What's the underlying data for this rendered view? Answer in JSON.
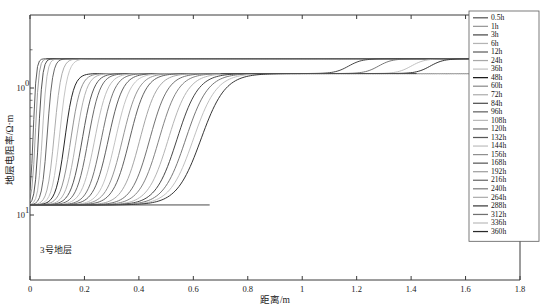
{
  "figure": {
    "background": "#ffffff",
    "plot_border_color": "#3a3a3a",
    "annotation": "3号地层"
  },
  "axes": {
    "x_title": "距离/m",
    "y_title": "地层电阻率/Ω·m",
    "x_ticks": [
      "0",
      "0.2",
      "0.4",
      "0.6",
      "0.8",
      "1",
      "1.2",
      "1.4",
      "1.6",
      "1.8"
    ],
    "y_ticks": [
      "10",
      "10"
    ],
    "y_tick_exponents": [
      "1",
      "0"
    ]
  },
  "chart_data": {
    "type": "line",
    "title": "",
    "xlabel": "距离/m",
    "ylabel": "地层电阻率/Ω·m",
    "xlim": [
      0,
      1.8
    ],
    "ylim": [
      1.0,
      22.0
    ],
    "yscale": "log",
    "grid": false,
    "legend_position": "upper-right",
    "annotation": "3号地层",
    "x_ticks": [
      0,
      0.2,
      0.4,
      0.6,
      0.8,
      1.0,
      1.2,
      1.4,
      1.6,
      1.8
    ],
    "y_ticks": [
      1,
      10
    ],
    "low_plateau": 1.2,
    "mid_plateau": 13.0,
    "high_plateau": 17.0,
    "series": [
      {
        "name": "0.5h",
        "color": "#555555",
        "front": 0.012,
        "top": 17.0,
        "width": 0.012
      },
      {
        "name": "1h",
        "color": "#9a9a9a",
        "front": 0.02,
        "top": 17.0,
        "width": 0.014
      },
      {
        "name": "3h",
        "color": "#4a4a4a",
        "front": 0.032,
        "top": 17.0,
        "width": 0.016
      },
      {
        "name": "6h",
        "color": "#b4b4b4",
        "front": 0.046,
        "top": 17.0,
        "width": 0.018
      },
      {
        "name": "12h",
        "color": "#5f5f5f",
        "front": 0.064,
        "top": 17.0,
        "width": 0.022
      },
      {
        "name": "24h",
        "color": "#a8a8a8",
        "front": 0.09,
        "top": 17.0,
        "width": 0.028
      },
      {
        "name": "36h",
        "color": "#c2c2c2",
        "front": 0.11,
        "top": 17.0,
        "width": 0.032
      },
      {
        "name": "48h",
        "color": "#1c1c1c",
        "front": 0.128,
        "top": 13.0,
        "width": 0.036
      },
      {
        "name": "60h",
        "color": "#8c8c8c",
        "front": 0.15,
        "top": 13.0,
        "width": 0.04
      },
      {
        "name": "72h",
        "color": "#aeaeae",
        "front": 0.17,
        "top": 13.0,
        "width": 0.042
      },
      {
        "name": "84h",
        "color": "#4f4f4f",
        "front": 0.192,
        "top": 13.0,
        "width": 0.046
      },
      {
        "name": "96h",
        "color": "#636363",
        "front": 0.214,
        "top": 13.0,
        "width": 0.048
      },
      {
        "name": "108h",
        "color": "#b9b9b9",
        "front": 0.238,
        "top": 13.0,
        "width": 0.052
      },
      {
        "name": "120h",
        "color": "#6e6e6e",
        "front": 0.262,
        "top": 13.0,
        "width": 0.054
      },
      {
        "name": "132h",
        "color": "#575757",
        "front": 0.288,
        "top": 13.0,
        "width": 0.058
      },
      {
        "name": "144h",
        "color": "#c0c0c0",
        "front": 0.314,
        "top": 13.0,
        "width": 0.06
      },
      {
        "name": "156h",
        "color": "#8f8f8f",
        "front": 0.34,
        "top": 13.0,
        "width": 0.064
      },
      {
        "name": "168h",
        "color": "#5a5a5a",
        "front": 0.366,
        "top": 13.0,
        "width": 0.066
      },
      {
        "name": "192h",
        "color": "#a0a0a0",
        "front": 0.404,
        "top": 13.0,
        "width": 0.07
      },
      {
        "name": "216h",
        "color": "#6a6a6a",
        "front": 0.44,
        "top": 13.0,
        "width": 0.074
      },
      {
        "name": "240h",
        "color": "#7d7d7d",
        "front": 0.474,
        "top": 13.0,
        "width": 0.078
      },
      {
        "name": "264h",
        "color": "#b0b0b0",
        "front": 0.508,
        "top": 13.0,
        "width": 0.082
      },
      {
        "name": "288h",
        "color": "#3c3c3c",
        "front": 0.54,
        "top": 13.0,
        "width": 0.086
      },
      {
        "name": "312h",
        "color": "#707070",
        "front": 0.572,
        "top": 13.0,
        "width": 0.09
      },
      {
        "name": "336h",
        "color": "#bdbdbd",
        "front": 0.6,
        "top": 13.0,
        "width": 0.094
      },
      {
        "name": "360h",
        "color": "#2a2a2a",
        "front": 0.628,
        "top": 13.0,
        "width": 0.098
      }
    ],
    "late_rise": {
      "description": "Three latest-time curves additionally rise from the 13 ohm-m mid plateau to the 17 ohm-m top plateau at large radius.",
      "fronts": [
        1.17,
        1.28,
        1.4,
        1.47
      ],
      "colors": [
        "#8a8a8a",
        "#aaaaaa",
        "#5a5a5a",
        "#2a2a2a"
      ]
    }
  },
  "legend": {
    "items": [
      {
        "label": "0.5h"
      },
      {
        "label": "1h"
      },
      {
        "label": "3h"
      },
      {
        "label": "6h"
      },
      {
        "label": "12h"
      },
      {
        "label": "24h"
      },
      {
        "label": "36h"
      },
      {
        "label": "48h"
      },
      {
        "label": "60h"
      },
      {
        "label": "72h"
      },
      {
        "label": "84h"
      },
      {
        "label": "96h"
      },
      {
        "label": "108h"
      },
      {
        "label": "120h"
      },
      {
        "label": "132h"
      },
      {
        "label": "144h"
      },
      {
        "label": "156h"
      },
      {
        "label": "168h"
      },
      {
        "label": "192h"
      },
      {
        "label": "216h"
      },
      {
        "label": "240h"
      },
      {
        "label": "264h"
      },
      {
        "label": "288h"
      },
      {
        "label": "312h"
      },
      {
        "label": "336h"
      },
      {
        "label": "360h"
      }
    ]
  }
}
